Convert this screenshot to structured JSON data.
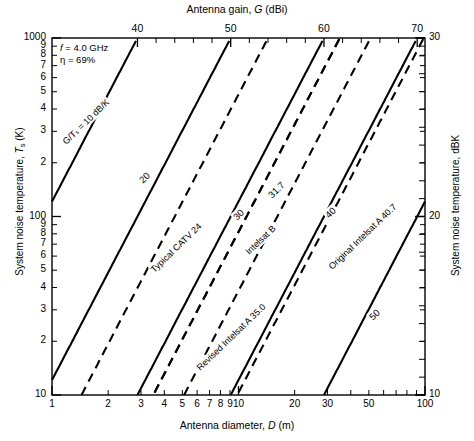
{
  "figure": {
    "top_axis_title_pre": "Antenna gain, ",
    "top_axis_title_ital": "G",
    "top_axis_title_post": " (dBi)",
    "bottom_axis_title_pre": "Antenna diameter, ",
    "bottom_axis_title_ital": "D",
    "bottom_axis_title_post": " (m)",
    "left_axis_title_pre": "System noise temperature, ",
    "left_axis_title_ital": "T",
    "left_axis_title_sub": "s",
    "left_axis_title_post": " (K)",
    "right_axis_title": "System noise temperature, dBK",
    "annotation": {
      "frequency_symbol": "f",
      "frequency_value": " = 4.0 GHz",
      "efficiency_symbol": "η",
      "efficiency_value": " = 69%"
    }
  },
  "chart_data": {
    "type": "line",
    "title": "",
    "xlabel": "Antenna diameter, D (m)",
    "ylabel": "System noise temperature, Ts (K)",
    "xscale": "log",
    "yscale": "log",
    "xlim": [
      1,
      100
    ],
    "ylim": [
      10,
      1000
    ],
    "grid": false,
    "legend": "inline-labels",
    "x_ticks_bottom": [
      "1",
      "2",
      "3",
      "4",
      "5",
      "6",
      "7",
      "8",
      "9",
      "10",
      "20",
      "30",
      "50",
      "100"
    ],
    "x_tick_values_bottom": [
      1,
      2,
      3,
      4,
      5,
      6,
      7,
      8,
      9,
      10,
      20,
      30,
      50,
      100
    ],
    "y_ticks_left": [
      "1000",
      "9",
      "8",
      "7",
      "6",
      "5",
      "4",
      "3",
      "2",
      "100",
      "9",
      "8",
      "7",
      "6",
      "5",
      "4",
      "3",
      "2",
      "10"
    ],
    "y_tick_values_left": [
      1000,
      900,
      800,
      700,
      600,
      500,
      400,
      300,
      200,
      100,
      90,
      80,
      70,
      60,
      50,
      40,
      30,
      20,
      10
    ],
    "top_axis": {
      "label": "Antenna gain, G (dBi)",
      "ticks": [
        "40",
        "50",
        "60",
        "70"
      ],
      "tick_values": [
        40,
        50,
        60,
        70
      ],
      "minor_tick_values": [
        42,
        44,
        46,
        48,
        52,
        54,
        56,
        58,
        62,
        64,
        66,
        68
      ],
      "relation": "G = 10*log10(eta*(pi*D*f/c)^2), eta=0.69, f=4.0 GHz"
    },
    "right_axis": {
      "label": "System noise temperature, dBK",
      "ticks": [
        "30",
        "20",
        "10"
      ],
      "tick_values": [
        30,
        20,
        10
      ]
    },
    "series": [
      {
        "name": "10",
        "label": "G/Tₛ = 10 dB/K",
        "gt_db": 10,
        "style": "solid",
        "label_rot": -44,
        "label_x": 60,
        "label_y": 140
      },
      {
        "name": "20",
        "label": "20",
        "gt_db": 20,
        "style": "solid",
        "label_rot": -44,
        "label_x": 136,
        "label_y": 178
      },
      {
        "name": "24",
        "label": "Typical CATV  24",
        "gt_db": 24,
        "style": "dashed",
        "label_rot": -44,
        "label_x": 148,
        "label_y": 268
      },
      {
        "name": "30",
        "label": "30",
        "gt_db": 30,
        "style": "solid",
        "label_rot": -44,
        "label_x": 230,
        "label_y": 215
      },
      {
        "name": "31.7",
        "label": "31.7",
        "gt_db": 31.7,
        "style": "dashed",
        "label_rot": -44,
        "label_x": 265,
        "label_y": 193
      },
      {
        "name": "35.0",
        "label": "Revised Intelsat A 35.0",
        "gt_db": 35.0,
        "style": "dashed",
        "label_rot": -44,
        "label_x": 194,
        "label_y": 366
      },
      {
        "name": "Intelsat B",
        "label": "Intelsat B",
        "gt_db": 31.7,
        "style": "dashed-alt",
        "label_rot": -44,
        "label_x": 243,
        "label_y": 250
      },
      {
        "name": "40",
        "label": "40",
        "gt_db": 40,
        "style": "solid",
        "label_rot": -44,
        "label_x": 322,
        "label_y": 213
      },
      {
        "name": "40.7",
        "label": "Original Intelsat A  40.7",
        "gt_db": 40.7,
        "style": "dashed",
        "label_rot": -44,
        "label_x": 326,
        "label_y": 265
      },
      {
        "name": "50",
        "label": "50",
        "gt_db": 50,
        "style": "solid",
        "label_rot": -44,
        "label_x": 366,
        "label_y": 315
      }
    ],
    "annotations": [
      "f = 4.0 GHz",
      "η = 69%"
    ]
  }
}
